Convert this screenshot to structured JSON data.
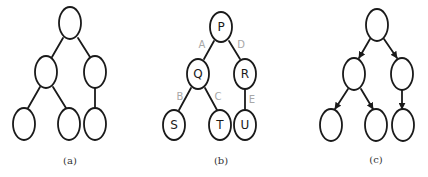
{
  "figure": {
    "panels": [
      {
        "id": "a",
        "caption": "(a)",
        "directed": false,
        "nodes": [
          {
            "id": "root",
            "label": ""
          },
          {
            "id": "l",
            "label": ""
          },
          {
            "id": "r",
            "label": ""
          },
          {
            "id": "ll",
            "label": ""
          },
          {
            "id": "lr",
            "label": ""
          },
          {
            "id": "rl",
            "label": ""
          }
        ],
        "edges": [
          {
            "from": "root",
            "to": "l",
            "label": ""
          },
          {
            "from": "root",
            "to": "r",
            "label": ""
          },
          {
            "from": "l",
            "to": "ll",
            "label": ""
          },
          {
            "from": "l",
            "to": "lr",
            "label": ""
          },
          {
            "from": "r",
            "to": "rl",
            "label": ""
          }
        ]
      },
      {
        "id": "b",
        "caption": "(b)",
        "directed": false,
        "nodes": [
          {
            "id": "root",
            "label": "P"
          },
          {
            "id": "l",
            "label": "Q"
          },
          {
            "id": "r",
            "label": "R"
          },
          {
            "id": "ll",
            "label": "S"
          },
          {
            "id": "lr",
            "label": "T"
          },
          {
            "id": "rl",
            "label": "U"
          }
        ],
        "edges": [
          {
            "from": "root",
            "to": "l",
            "label": "A"
          },
          {
            "from": "root",
            "to": "r",
            "label": "D"
          },
          {
            "from": "l",
            "to": "ll",
            "label": "B"
          },
          {
            "from": "l",
            "to": "lr",
            "label": "C"
          },
          {
            "from": "r",
            "to": "rl",
            "label": "E"
          }
        ]
      },
      {
        "id": "c",
        "caption": "(c)",
        "directed": true,
        "nodes": [
          {
            "id": "root",
            "label": ""
          },
          {
            "id": "l",
            "label": ""
          },
          {
            "id": "r",
            "label": ""
          },
          {
            "id": "ll",
            "label": ""
          },
          {
            "id": "lr",
            "label": ""
          },
          {
            "id": "rl",
            "label": ""
          }
        ],
        "edges": [
          {
            "from": "root",
            "to": "l",
            "label": ""
          },
          {
            "from": "root",
            "to": "r",
            "label": ""
          },
          {
            "from": "l",
            "to": "ll",
            "label": ""
          },
          {
            "from": "l",
            "to": "lr",
            "label": ""
          },
          {
            "from": "r",
            "to": "rl",
            "label": ""
          }
        ]
      }
    ],
    "colors": {
      "stroke": "#1a1a1a",
      "edge_label": "#a8a8a8",
      "background": "#ffffff"
    }
  }
}
